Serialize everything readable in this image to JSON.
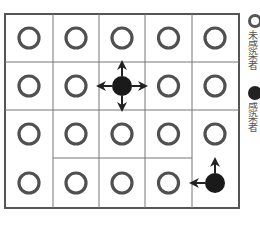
{
  "diagram": {
    "grid": {
      "rows": 4,
      "cols": 5,
      "cells": [
        [
          "uninfected",
          "uninfected",
          "uninfected",
          "uninfected",
          "uninfected"
        ],
        [
          "uninfected",
          "uninfected",
          "infected",
          "uninfected",
          "uninfected"
        ],
        [
          "uninfected",
          "uninfected",
          "uninfected",
          "uninfected",
          "uninfected"
        ],
        [
          "uninfected",
          "uninfected",
          "uninfected",
          "uninfected",
          "infected"
        ]
      ],
      "spread_arrows": [
        {
          "from": [
            1,
            2
          ],
          "directions": [
            "up",
            "down",
            "left",
            "right"
          ]
        },
        {
          "from": [
            3,
            4
          ],
          "directions": [
            "up",
            "left"
          ]
        }
      ]
    },
    "legend": {
      "items": [
        {
          "icon": "open-circle-icon",
          "label": "未感染者"
        },
        {
          "icon": "filled-circle-icon",
          "label": "感染者"
        }
      ]
    },
    "colors": {
      "line": "#555555",
      "uninfected_stroke": "#505050",
      "infected_fill": "#1a1a1a",
      "background": "#ffffff"
    }
  }
}
